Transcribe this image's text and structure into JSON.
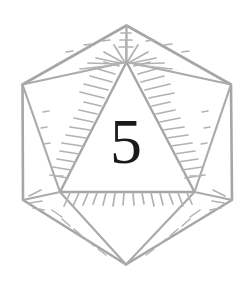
{
  "figure": {
    "name": "d20-die",
    "style": "hand-drawn line illustration"
  },
  "face": {
    "value": "5"
  },
  "colors": {
    "background": "#ffffff",
    "line": "#a6a6a6",
    "line_light": "#bdbdbd",
    "hatch": "#b2b2b2",
    "numeral": "#1a1a1a"
  },
  "geometry": {
    "top_apex": [
      126,
      25
    ],
    "upper_left": [
      23,
      84
    ],
    "upper_right": [
      231,
      84
    ],
    "lower_left": [
      23,
      200
    ],
    "lower_right": [
      232,
      200
    ],
    "bottom_apex": [
      126,
      264
    ],
    "inner_apex": [
      126,
      62
    ],
    "inner_bottom_left": [
      60,
      192
    ],
    "inner_bottom_right": [
      194,
      192
    ]
  }
}
